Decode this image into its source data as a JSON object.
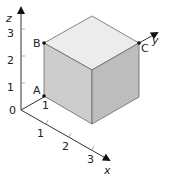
{
  "diagram": {
    "axes": {
      "x": {
        "label": "x",
        "ticks": [
          "1",
          "2",
          "3"
        ]
      },
      "y": {
        "label": "y"
      },
      "z": {
        "label": "z",
        "ticks": [
          "1",
          "2",
          "3"
        ]
      },
      "origin_label": "0"
    },
    "points": {
      "A": {
        "label": "A",
        "y_tick": "1"
      },
      "B": {
        "label": "B"
      },
      "C": {
        "label": "C"
      }
    },
    "colors": {
      "top_face": "#ececec",
      "left_face": "#c8c8c8",
      "right_face": "#b8b8b8",
      "edge": "#555555",
      "axis": "#333333"
    }
  }
}
